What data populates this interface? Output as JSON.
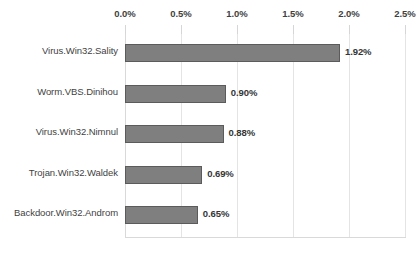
{
  "chart_data": {
    "type": "bar",
    "orientation": "horizontal",
    "title": "",
    "subtitle": "",
    "xlabel": "",
    "ylabel": "",
    "categories": [
      "Virus.Win32.Sality",
      "Worm.VBS.Dinihou",
      "Virus.Win32.Nimnul",
      "Trojan.Win32.Waldek",
      "Backdoor.Win32.Androm"
    ],
    "values": [
      1.92,
      0.9,
      0.88,
      0.69,
      0.65
    ],
    "value_labels": [
      "1.92%",
      "0.90%",
      "0.88%",
      "0.69%",
      "0.65%"
    ],
    "xlim": [
      0.0,
      2.5
    ],
    "xticks": [
      0.0,
      0.5,
      1.0,
      1.5,
      2.0,
      2.5
    ],
    "xtick_labels": [
      "0.0%",
      "0.5%",
      "1.0%",
      "1.5%",
      "2.0%",
      "2.5%"
    ],
    "grid": true,
    "grid_axis": "x",
    "legend": false,
    "legend_position": "none",
    "axis_position": "top",
    "series": [
      {
        "name": "",
        "values": [
          1.92,
          0.9,
          0.88,
          0.69,
          0.65
        ]
      }
    ]
  },
  "style": {
    "bar_fill": "#7f7f7f",
    "bar_border": "#5b5b5b",
    "gridline_color": "#e4e4e4",
    "axis_color": "#d9d9d9",
    "text_color": "#3f3f3f",
    "value_text_color": "#353535",
    "background": "#ffffff"
  }
}
